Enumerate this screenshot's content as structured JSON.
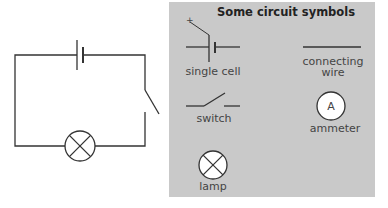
{
  "panel": {
    "title": "Some circuit symbols",
    "background": "#c9c9c9",
    "symbols": {
      "single_cell": {
        "label": "single cell",
        "polarity_mark": "+"
      },
      "connecting_wire": {
        "label_line1": "connecting",
        "label_line2": "wire"
      },
      "switch": {
        "label": "switch"
      },
      "ammeter": {
        "label": "ammeter",
        "glyph": "A"
      },
      "lamp": {
        "label": "lamp"
      }
    }
  },
  "circuit": {
    "components": [
      "single cell",
      "open switch",
      "lamp"
    ]
  }
}
